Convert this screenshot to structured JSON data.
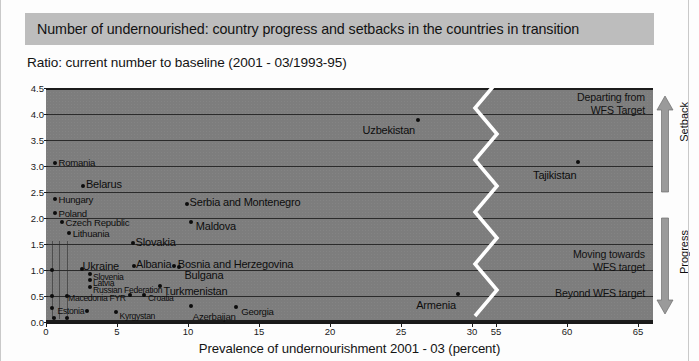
{
  "banner": {
    "title": "Number of undernourished: country progress and setbacks in the countries in transition"
  },
  "subtitle": "Ratio: current number to baseline (2001 - 03/1993-95)",
  "colors": {
    "banner_bg": "#bdbdbd",
    "plot_bg": "#7d7d7d",
    "grid": "#2b2b2b",
    "point": "#0c0c0c",
    "text": "#121212",
    "break_line": "#ffffff",
    "arrow": "#9a9a9a"
  },
  "annotations": {
    "departing": "Departing from\nWFS Target",
    "moving_towards": "Moving towards\nWFS target",
    "beyond": "Beyond WFS target",
    "setback_axis": "Setback",
    "progress_axis": "Progress"
  },
  "chart_data": {
    "type": "scatter",
    "title": "Number of undernourished: country progress and setbacks in the countries in transition",
    "subtitle": "Ratio: current number to baseline (2001 - 03/1993-95)",
    "xlabel": "Prevalence of undernourishment 2001 - 03 (percent)",
    "ylabel": "Ratio: current number to baseline (2001 - 03/1993-95)",
    "xlim": [
      0,
      65
    ],
    "ylim": [
      0.0,
      4.5
    ],
    "axis_break": {
      "from": 30,
      "to": 55
    },
    "xticks": [
      0,
      5,
      10,
      15,
      20,
      25,
      30,
      55,
      60,
      65
    ],
    "yticks": [
      0.0,
      0.5,
      1.0,
      1.5,
      2.0,
      2.5,
      3.0,
      3.5,
      4.0,
      4.5
    ],
    "grid": "horizontal",
    "legend": "none",
    "points": [
      {
        "name": "Romania",
        "x": 0.6,
        "y": 3.05,
        "label_dx": 4,
        "label_dy": -5,
        "size": "md"
      },
      {
        "name": "Belarus",
        "x": 2.6,
        "y": 2.62,
        "label_dx": 3,
        "label_dy": -7,
        "size": "lg"
      },
      {
        "name": "Hungary",
        "x": 0.6,
        "y": 2.36,
        "label_dx": 4,
        "label_dy": -4,
        "size": "md"
      },
      {
        "name": "Poland",
        "x": 0.6,
        "y": 2.1,
        "label_dx": 4,
        "label_dy": -4,
        "size": "md"
      },
      {
        "name": "Serbia and Montenegro",
        "x": 9.9,
        "y": 2.26,
        "label_dx": 3,
        "label_dy": -7,
        "size": "lg"
      },
      {
        "name": "Czech Republic",
        "x": 1.1,
        "y": 1.92,
        "label_dx": 4,
        "label_dy": -4,
        "size": "md"
      },
      {
        "name": "Maldova",
        "x": 10.2,
        "y": 1.92,
        "label_dx": 5,
        "label_dy": -1,
        "size": "lg"
      },
      {
        "name": "Lithuania",
        "x": 1.6,
        "y": 1.72,
        "label_dx": 4,
        "label_dy": -4,
        "size": "md"
      },
      {
        "name": "Slovakia",
        "x": 6.1,
        "y": 1.52,
        "label_dx": 3,
        "label_dy": -6,
        "size": "lg"
      },
      {
        "name": "Ukraine",
        "x": 2.5,
        "y": 1.02,
        "label_dx": 1,
        "label_dy": -8,
        "size": "lg"
      },
      {
        "name": "Albania",
        "x": 6.2,
        "y": 1.08,
        "label_dx": 2,
        "label_dy": -7,
        "size": "lg"
      },
      {
        "name": "Bosnia and Herzegovina",
        "x": 9.0,
        "y": 1.08,
        "label_dx": 4,
        "label_dy": -7,
        "size": "lg"
      },
      {
        "name": "Bulgana",
        "x": 9.4,
        "y": 1.06,
        "label_dx": 5,
        "label_dy": 3,
        "size": "lg"
      },
      {
        "name": "Slovenia",
        "x": 3.1,
        "y": 0.93,
        "label_dx": 3,
        "label_dy": -1,
        "size": "sm"
      },
      {
        "name": "Latvia",
        "x": 3.1,
        "y": 0.8,
        "label_dx": 3,
        "label_dy": -1,
        "size": "sm"
      },
      {
        "name": "Russian Federation",
        "x": 3.1,
        "y": 0.68,
        "label_dx": 3,
        "label_dy": -1,
        "size": "sm"
      },
      {
        "name": "Turkmenistan",
        "x": 8.0,
        "y": 0.7,
        "label_dx": 4,
        "label_dy": 0,
        "size": "lg"
      },
      {
        "name": "Macedonia FYR",
        "x": 5.9,
        "y": 0.52,
        "label_dx": -4,
        "label_dy": -1,
        "size": "sm",
        "align": "right"
      },
      {
        "name": "Croatia",
        "x": 6.9,
        "y": 0.52,
        "label_dx": 4,
        "label_dy": -1,
        "size": "sm"
      },
      {
        "name": "Estonia",
        "x": 2.9,
        "y": 0.21,
        "label_dx": -3,
        "label_dy": -4,
        "size": "sm",
        "align": "right"
      },
      {
        "name": "Kyrgystan",
        "x": 4.9,
        "y": 0.2,
        "label_dx": 4,
        "label_dy": 0,
        "size": "sm"
      },
      {
        "name": "Azerbaijan",
        "x": 10.2,
        "y": 0.3,
        "label_dx": 2,
        "label_dy": 6,
        "size": "md"
      },
      {
        "name": "Georgia",
        "x": 13.4,
        "y": 0.28,
        "label_dx": 5,
        "label_dy": 0,
        "size": "md"
      },
      {
        "name": "Armenia",
        "x": 29.0,
        "y": 0.54,
        "label_dx": -2,
        "label_dy": 6,
        "size": "lg",
        "align": "right"
      },
      {
        "name": "Uzbekistan",
        "x": 26.2,
        "y": 3.89,
        "label_dx": -3,
        "label_dy": 5,
        "size": "lg",
        "align": "right"
      },
      {
        "name": "Tajikistan",
        "x": 60.8,
        "y": 3.08,
        "label_dx": -2,
        "label_dy": 8,
        "size": "lg",
        "align": "right"
      }
    ],
    "unlabeled_points": [
      {
        "x": 0.45,
        "y": 1.0
      },
      {
        "x": 0.45,
        "y": 0.5
      },
      {
        "x": 1.45,
        "y": 0.5
      },
      {
        "x": 0.45,
        "y": 0.26
      },
      {
        "x": 0.55,
        "y": 0.08
      },
      {
        "x": 1.45,
        "y": 0.08
      }
    ]
  }
}
